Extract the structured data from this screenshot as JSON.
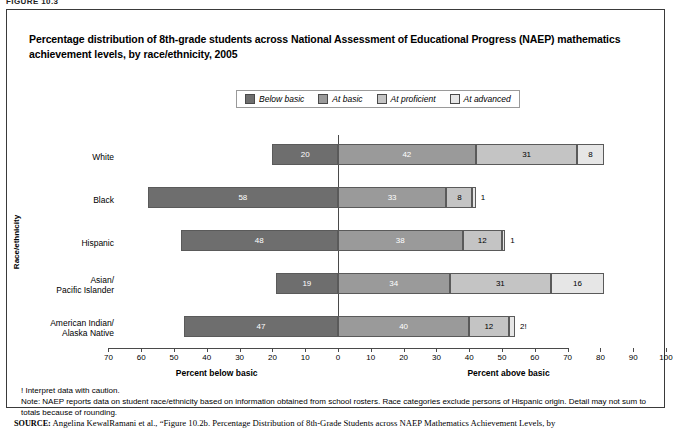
{
  "figure_label": "FIGURE 10.3",
  "title": "Percentage distribution of 8th-grade students across National Assessment of Educational Progress (NAEP) mathematics achievement levels, by race/ethnicity, 2005",
  "legend": {
    "items": [
      {
        "label": "Below basic",
        "color": "#6e6e6e"
      },
      {
        "label": "At basic",
        "color": "#9a9a9a"
      },
      {
        "label": "At proficient",
        "color": "#c4c4c4"
      },
      {
        "label": "At advanced",
        "color": "#e6e6e6"
      }
    ]
  },
  "axes": {
    "y_title": "Race/ethnicity",
    "x_ticks": [
      "70",
      "60",
      "50",
      "40",
      "30",
      "20",
      "10",
      "0",
      "10",
      "20",
      "30",
      "40",
      "50",
      "60",
      "70",
      "80",
      "90",
      "100"
    ],
    "x_left_title": "Percent below basic",
    "x_right_title": "Percent above basic"
  },
  "notes": {
    "caution": "! Interpret data with caution.",
    "note": "Note: NAEP reports data on student race/ethnicity based on information obtained from school rosters. Race categories exclude persons of Hispanic origin. Detail may not sum to totals because of rounding."
  },
  "source": {
    "keyword": "SOURCE:",
    "text": " Angelina KewalRamani et al., “Figure 10.2b. Percentage Distribution of 8th-Grade Students across NAEP Mathematics Achievement Levels, by"
  },
  "chart_data": {
    "type": "bar",
    "subtype": "diverging-stacked-horizontal",
    "title": "Percentage distribution of 8th-grade students across National Assessment of Educational Progress (NAEP) mathematics achievement levels, by race/ethnicity, 2005",
    "xlabel": "Percent",
    "ylabel": "Race/ethnicity",
    "xlim": [
      -70,
      100
    ],
    "grid": false,
    "legend_position": "top-center",
    "categories": [
      "White",
      "Black",
      "Hispanic",
      "Asian/\nPacific Islander",
      "American Indian/\nAlaska Native"
    ],
    "series": [
      {
        "name": "Below basic",
        "color": "#6e6e6e",
        "values": [
          20,
          58,
          48,
          19,
          47
        ]
      },
      {
        "name": "At basic",
        "color": "#9a9a9a",
        "values": [
          42,
          33,
          38,
          34,
          40
        ]
      },
      {
        "name": "At proficient",
        "color": "#c4c4c4",
        "values": [
          31,
          8,
          12,
          31,
          12
        ]
      },
      {
        "name": "At advanced",
        "color": "#e6e6e6",
        "values": [
          8,
          1,
          1,
          16,
          2
        ]
      }
    ],
    "data_labels": [
      {
        "category": "White",
        "below_basic": "20",
        "at_basic": "42",
        "at_proficient": "31",
        "at_advanced": "8"
      },
      {
        "category": "Black",
        "below_basic": "58",
        "at_basic": "33",
        "at_proficient": "8",
        "at_advanced": "1"
      },
      {
        "category": "Hispanic",
        "below_basic": "48",
        "at_basic": "38",
        "at_proficient": "12",
        "at_advanced": "1"
      },
      {
        "category": "Asian/Pacific Islander",
        "below_basic": "19",
        "at_basic": "34",
        "at_proficient": "31",
        "at_advanced": "16"
      },
      {
        "category": "American Indian/Alaska Native",
        "below_basic": "47",
        "at_basic": "40",
        "at_proficient": "12",
        "at_advanced": "2!"
      }
    ]
  }
}
